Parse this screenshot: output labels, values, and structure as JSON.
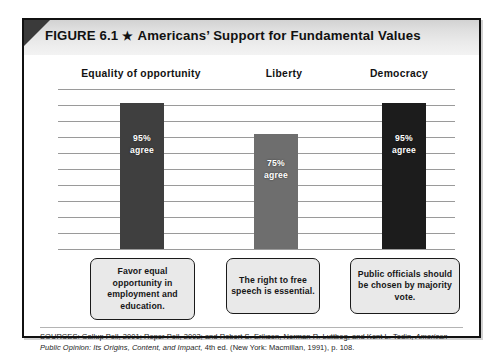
{
  "figure": {
    "number_label": "FIGURE 6.1",
    "star_glyph": "★",
    "title": "Americans’ Support for Fundamental Values"
  },
  "chart_data": {
    "type": "bar",
    "title": "Americans’ Support for Fundamental Values",
    "xlabel": "",
    "ylabel": "",
    "ylim": [
      0,
      100
    ],
    "grid": true,
    "gridline_count": 10,
    "legend_position": "none",
    "categories": [
      "Equality of opportunity",
      "Liberty",
      "Democracy"
    ],
    "values": [
      95,
      75,
      95
    ],
    "value_labels": [
      "95%",
      "75%",
      "95%"
    ],
    "value_sublabels": [
      "agree",
      "agree",
      "agree"
    ],
    "bar_colors": [
      "#3f3f3f",
      "#6e6e6e",
      "#1c1c1c"
    ],
    "bars": [
      {
        "category": "Equality of opportunity",
        "value": 95,
        "percent_label": "95%",
        "agree_label": "agree",
        "color": "#3f3f3f",
        "caption": "Favor equal opportunity in employment and education."
      },
      {
        "category": "Liberty",
        "value": 75,
        "percent_label": "75%",
        "agree_label": "agree",
        "color": "#6e6e6e",
        "caption": "The right to free speech is essential."
      },
      {
        "category": "Democracy",
        "value": 95,
        "percent_label": "95%",
        "agree_label": "agree",
        "color": "#1c1c1c",
        "caption": "Public officials should be chosen by majority vote."
      }
    ]
  },
  "sources": {
    "line1_prefix": "SOURCES: Gallup Poll, 2001; Roper Poll, 2002; and Robert S. Erikson, Norman R. Luttbeg, and Kent L. Tedin,",
    "italic_title": "American Public Opinion: Its Origins, Content, and Impact,",
    "line2_suffix": " 4th ed. (New York: Macmillan, 1991), p. 108."
  },
  "colors": {
    "frame": "#111111",
    "header_band_light": "#f3f3f3",
    "header_band_dark": "#d2d2d2",
    "corner_fold": "#3a3a3a",
    "gridline": "#9a9a9a",
    "caption_fill": "#e9e9e9"
  }
}
